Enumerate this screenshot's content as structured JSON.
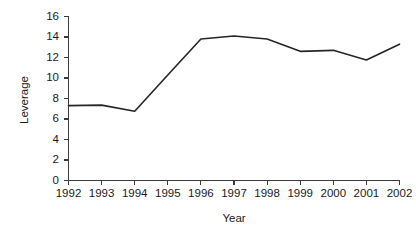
{
  "chart_data": {
    "type": "line",
    "title": "",
    "xlabel": "Year",
    "ylabel": "Leverage",
    "categories": [
      "1992",
      "1993",
      "1994",
      "1995",
      "1996",
      "1997",
      "1998",
      "1999",
      "2000",
      "2001",
      "2002"
    ],
    "x": [
      1992,
      1993,
      1994,
      1995,
      1996,
      1997,
      1998,
      1999,
      2000,
      2001,
      2002
    ],
    "values": [
      7.3,
      7.35,
      6.75,
      10.3,
      13.8,
      14.1,
      13.8,
      12.6,
      12.7,
      11.75,
      13.3
    ],
    "series": [
      {
        "name": "Leverage",
        "values": [
          7.3,
          7.35,
          6.75,
          10.3,
          13.8,
          14.1,
          13.8,
          12.6,
          12.7,
          11.75,
          13.3
        ]
      }
    ],
    "ylim": [
      0,
      16
    ],
    "xlim": [
      1992,
      2002
    ],
    "yticks": [
      0,
      2,
      4,
      6,
      8,
      10,
      12,
      14,
      16
    ],
    "ytick_labels": [
      "0",
      "2",
      "4",
      "6",
      "8",
      "10",
      "12",
      "14",
      "16"
    ],
    "xticks": [
      1992,
      1993,
      1994,
      1995,
      1996,
      1997,
      1998,
      1999,
      2000,
      2001,
      2002
    ],
    "grid": false,
    "legend": false,
    "legend_position": "none",
    "line_color": "#262626",
    "axis_color": "#3c3c3c",
    "background_color": "#ffffff"
  },
  "labels": {
    "y_axis_title": "Leverage",
    "x_axis_title": "Year"
  }
}
